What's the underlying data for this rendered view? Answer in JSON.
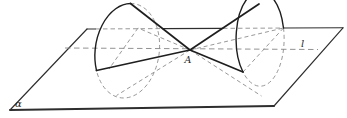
{
  "figure": {
    "type": "geometry-diagram",
    "labels": {
      "apex": "A",
      "axis_line": "l",
      "plane": "α"
    },
    "colors": {
      "background": "#ffffff",
      "solid_outline": "#1e1e1e",
      "plane_edge": "#2e2e2e",
      "hidden_line": "#8c8c8c"
    }
  }
}
